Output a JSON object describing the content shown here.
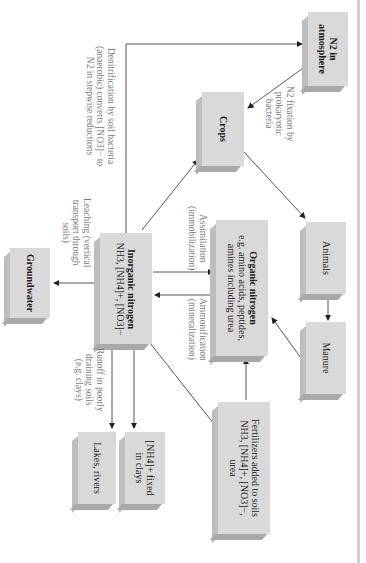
{
  "diagram": {
    "orientation": "rotated 90 degrees clockwise",
    "nodes": {
      "n2_atmosphere": {
        "line1": "N2 in",
        "line2": "atmosphere"
      },
      "crops": {
        "label": "Crops"
      },
      "animals": {
        "label": "Animals"
      },
      "manure": {
        "label": "Manure"
      },
      "organic_nitrogen": {
        "title": "Organic nitrogen",
        "line1": "e.g. amino acids, peptides,",
        "line2": "amines including urea"
      },
      "inorganic_nitrogen": {
        "title": "Inorganic nitrogen",
        "line1": "NH3, [NH4]+, [NO3]−"
      },
      "groundwater": {
        "label": "Groundwater"
      },
      "lakes_rivers": {
        "label": "Lakes, rivers"
      },
      "nh4_fixed": {
        "line1": "[NH4]+ fixed",
        "line2": "in clays"
      },
      "fertilizers": {
        "line1": "Fertilizers added to soils",
        "line2": "NH3, [NH4]+, [NO3]−,",
        "line3": "urea"
      }
    },
    "edge_labels": {
      "denitrification": {
        "line1": "Denitrification by soil bacteria",
        "line2": "(anaerobic) converts [NO3]− to",
        "line3": "N2 in stepwise reductions"
      },
      "n2_fixation": {
        "line1": "N2 fixation by",
        "line2": "prokaryotic",
        "line3": "bacteria"
      },
      "assimilation": {
        "line1": "Assimilation",
        "line2": "(immobilization)"
      },
      "ammonification": {
        "line1": "Ammonification",
        "line2": "(mineralization)"
      },
      "leaching": {
        "line1": "Leaching (vertical",
        "line2": "transport through",
        "line3": "soils)"
      },
      "runoff": {
        "line1": "Runoff in poorly",
        "line2": "draining soils",
        "line3": "(e.g. clays)"
      }
    },
    "colors": {
      "box_face": "#d9d9d9",
      "box_side": "#bdbdbd",
      "box_bottom": "#a9a9a9",
      "arrow": "#333333",
      "label_text": "#7a7a7a"
    }
  }
}
